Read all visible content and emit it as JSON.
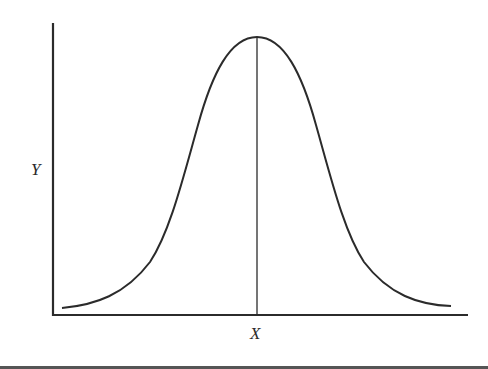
{
  "figure": {
    "type": "normal-distribution-diagram",
    "x_axis_label": "X",
    "y_axis_label": "Y",
    "curve": "bell-shaped (normal) curve",
    "center_line": "vertical line at the mean from peak to x-axis",
    "colors": {
      "background": "#ffffff",
      "ink": "#2b2b2b"
    }
  }
}
